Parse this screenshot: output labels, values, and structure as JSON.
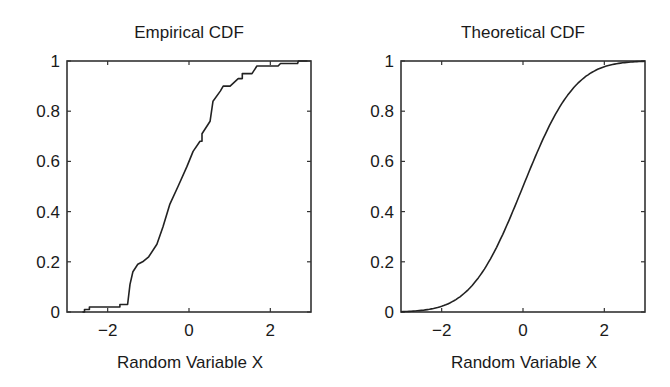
{
  "chart_data": [
    {
      "type": "line",
      "step": true,
      "title": "Empirical CDF",
      "xlabel": "Random Variable X",
      "ylabel": "",
      "xlim": [
        -3,
        3
      ],
      "ylim": [
        0,
        1
      ],
      "xticks": [
        -2,
        0,
        2
      ],
      "xtick_labels": [
        "−2",
        "0",
        "2"
      ],
      "yticks": [
        0,
        0.2,
        0.4,
        0.6,
        0.8,
        1
      ],
      "ytick_labels": [
        "0",
        "0.2",
        "0.4",
        "0.6",
        "0.8",
        "1"
      ],
      "grid": false,
      "legend": null,
      "series": [
        {
          "name": "Empirical CDF",
          "x": [
            -2.62,
            -2.57,
            -2.57,
            -2.45,
            -2.45,
            -1.7,
            -1.7,
            -1.51,
            -1.45,
            -1.38,
            -1.26,
            -1.14,
            -0.99,
            -0.79,
            -0.64,
            -0.47,
            -0.27,
            -0.05,
            0.1,
            0.27,
            0.32,
            0.32,
            0.52,
            0.59,
            0.77,
            0.84,
            1.01,
            1.21,
            1.31,
            1.31,
            1.55,
            1.67,
            1.8,
            2.19,
            2.25,
            2.67,
            2.69,
            2.91
          ],
          "y": [
            0.0,
            0.0,
            0.01,
            0.01,
            0.02,
            0.02,
            0.03,
            0.03,
            0.11,
            0.16,
            0.19,
            0.2,
            0.22,
            0.27,
            0.34,
            0.43,
            0.5,
            0.58,
            0.64,
            0.68,
            0.68,
            0.71,
            0.76,
            0.84,
            0.88,
            0.9,
            0.9,
            0.93,
            0.93,
            0.95,
            0.95,
            0.98,
            0.98,
            0.98,
            0.99,
            0.99,
            1.0,
            1.0
          ]
        }
      ]
    },
    {
      "type": "line",
      "title": "Theoretical CDF",
      "xlabel": "Random Variable X",
      "ylabel": "",
      "xlim": [
        -3,
        3
      ],
      "ylim": [
        0,
        1
      ],
      "xticks": [
        -2,
        0,
        2
      ],
      "xtick_labels": [
        "−2",
        "0",
        "2"
      ],
      "yticks": [
        0,
        0.2,
        0.4,
        0.6,
        0.8,
        1
      ],
      "ytick_labels": [
        "0",
        "0.2",
        "0.4",
        "0.6",
        "0.8",
        "1"
      ],
      "grid": false,
      "legend": null,
      "series": [
        {
          "name": "Standard normal CDF",
          "x": [
            -3.0,
            -2.5,
            -2.0,
            -1.5,
            -1.0,
            -0.5,
            0.0,
            0.5,
            1.0,
            1.5,
            2.0,
            2.5,
            3.0
          ],
          "y": [
            0.001,
            0.006,
            0.023,
            0.067,
            0.159,
            0.309,
            0.5,
            0.691,
            0.841,
            0.933,
            0.977,
            0.994,
            0.999
          ]
        }
      ]
    }
  ],
  "plots": {
    "left": {
      "title": "Empirical CDF",
      "xlabel": "Random Variable X"
    },
    "right": {
      "title": "Theoretical CDF",
      "xlabel": "Random Variable X"
    }
  },
  "colors": {
    "line": "#222222",
    "axes": "#333333",
    "background": "#ffffff"
  }
}
